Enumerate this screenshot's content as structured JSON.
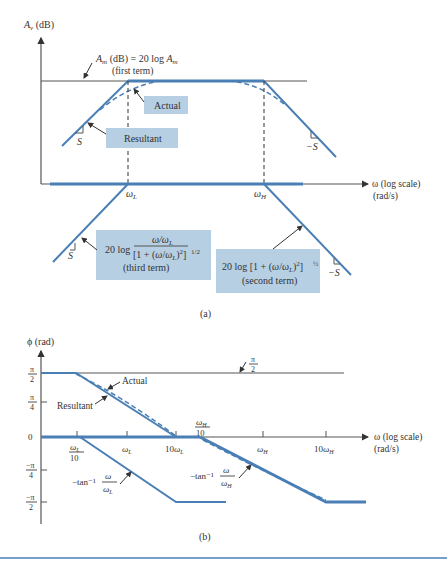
{
  "figure_a": {
    "y_axis_label": "A_v (dB)",
    "x_axis_label": "ω (log scale)",
    "x_axis_unit": "(rad/s)",
    "first_term_label_line1": "A_m (dB) = 20 log A_m",
    "first_term_label_line2": "(first term)",
    "actual_label": "Actual",
    "resultant_label": "Resultant",
    "slope_pos": "S",
    "slope_neg": "−S",
    "slope_pos_bottom": "S",
    "slope_neg_bottom": "−S",
    "omega_L": "ωL",
    "omega_H": "ωH",
    "third_term_prefix": "20 log",
    "third_term_numerator": "ω/ωL",
    "third_term_denominator": "[1 + (ω/ωL)²]",
    "third_term_exp": "1/2",
    "third_term_caption": "(third term)",
    "second_term_expr": "20 log [1 + (ω/ωL)²]",
    "second_term_exp": "½",
    "second_term_caption": "(second term)",
    "caption": "(a)"
  },
  "figure_b": {
    "y_axis_label": "ϕ (rad)",
    "x_axis_label": "ω (log scale)",
    "x_axis_unit": "(rad/s)",
    "y_ticks": [
      {
        "num": "π",
        "den": "2"
      },
      {
        "num": "π",
        "den": "4"
      },
      {
        "num": "0",
        "den": ""
      },
      {
        "num": "−π",
        "den": "4"
      },
      {
        "num": "−π",
        "den": "2"
      }
    ],
    "x_ticks": [
      {
        "num": "ωL",
        "den": "10"
      },
      {
        "num": "ωL",
        "den": ""
      },
      {
        "num": "10ωL",
        "den": ""
      },
      {
        "num": "ωH",
        "den": "10"
      },
      {
        "num": "ωH",
        "den": ""
      },
      {
        "num": "10ωH",
        "den": ""
      }
    ],
    "pi_half_num": "π",
    "pi_half_den": "2",
    "actual_label": "Actual",
    "resultant_label": "Resultant",
    "tanL_prefix": "−tan⁻¹",
    "tanL_num": "ω",
    "tanL_den": "ωL",
    "tanH_prefix": "−tan⁻¹",
    "tanH_num": "ω",
    "tanH_den": "ωH",
    "caption": "(b)"
  },
  "colors": {
    "curve": "#4a7fb5",
    "label_box": "#b7cfe3",
    "rule": "#4a7fb5"
  }
}
